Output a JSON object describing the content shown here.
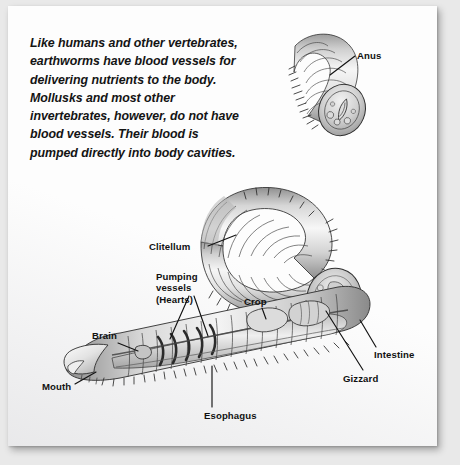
{
  "page": {
    "background_color": "#e9e9e9",
    "card_color": "#fdfdfd"
  },
  "caption": {
    "text": "Like humans and other vertebrates, earthworms have blood vessels for delivering nutrients to the body. Mollusks and most other invertebrates, however, do not have blood vessels. Their blood is pumped directly into body cavities."
  },
  "diagram": {
    "subject": "earthworm",
    "style": "grayscale pencil illustration, cutaway",
    "ink_color": "#1a1a1a",
    "body_light": "#f4f4f4",
    "body_mid": "#c9c9c9",
    "body_dark": "#8d8d8d",
    "labels": [
      {
        "id": "anus",
        "text": "Anus"
      },
      {
        "id": "clitellum",
        "text": "Clitellum"
      },
      {
        "id": "pumping",
        "text": "Pumping vessels (Hearts)"
      },
      {
        "id": "crop",
        "text": "Crop"
      },
      {
        "id": "brain",
        "text": "Brain"
      },
      {
        "id": "intestine",
        "text": "Intestine"
      },
      {
        "id": "gizzard",
        "text": "Gizzard"
      },
      {
        "id": "mouth",
        "text": "Mouth"
      },
      {
        "id": "esophagus",
        "text": "Esophagus"
      }
    ]
  }
}
